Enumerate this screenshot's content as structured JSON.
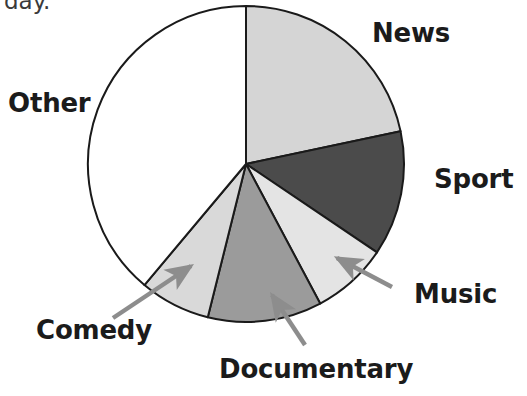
{
  "chart_data": {
    "type": "pie",
    "title": "",
    "subtitle": "",
    "xlabel": "",
    "ylabel": "",
    "legend_position": "callout-labels",
    "grid": false,
    "center": {
      "x": 246,
      "y": 164
    },
    "radius": 158,
    "start_angle_deg": 0,
    "direction": "clockwise",
    "categories": [
      "News",
      "Sport",
      "Music",
      "Documentary",
      "Comedy",
      "Other"
    ],
    "values": [
      78,
      46,
      28,
      42,
      26,
      140
    ],
    "unit": "degrees",
    "percentages": [
      21.7,
      12.8,
      7.8,
      11.7,
      7.2,
      38.9
    ],
    "slices": [
      {
        "label": "News",
        "start_deg": 0,
        "end_deg": 78,
        "sweep_deg": 78,
        "percent": 21.7,
        "color": "#d5d5d5",
        "label_mode": "direct",
        "label_x": 372,
        "label_y": 20
      },
      {
        "label": "Sport",
        "start_deg": 78,
        "end_deg": 124,
        "sweep_deg": 46,
        "percent": 12.8,
        "color": "#4b4b4b",
        "label_mode": "direct",
        "label_x": 434,
        "label_y": 166
      },
      {
        "label": "Music",
        "start_deg": 124,
        "end_deg": 152,
        "sweep_deg": 28,
        "percent": 7.8,
        "color": "#e4e4e4",
        "label_mode": "arrow",
        "label_x": 414,
        "label_y": 281
      },
      {
        "label": "Documentary",
        "start_deg": 152,
        "end_deg": 194,
        "sweep_deg": 42,
        "percent": 11.7,
        "color": "#9b9b9b",
        "label_mode": "arrow",
        "label_x": 219,
        "label_y": 356
      },
      {
        "label": "Comedy",
        "start_deg": 194,
        "end_deg": 220,
        "sweep_deg": 26,
        "percent": 7.2,
        "color": "#d9d9d9",
        "label_mode": "arrow",
        "label_x": 36,
        "label_y": 317
      },
      {
        "label": "Other",
        "start_deg": 220,
        "end_deg": 360,
        "sweep_deg": 140,
        "percent": 38.9,
        "color": "#ffffff",
        "label_mode": "direct",
        "label_x": 8,
        "label_y": 90
      }
    ],
    "callouts": [
      {
        "target": "Music",
        "from_x": 392,
        "from_y": 287,
        "to_x": 337,
        "to_y": 258
      },
      {
        "target": "Documentary",
        "from_x": 305,
        "from_y": 345,
        "to_x": 272,
        "to_y": 295
      },
      {
        "target": "Comedy",
        "from_x": 113,
        "from_y": 318,
        "to_x": 191,
        "to_y": 266
      }
    ],
    "stroke_color": "#1a1a1a",
    "arrow_color": "#8d8d8d",
    "background": "#ffffff"
  },
  "labels": {
    "news": "News",
    "sport": "Sport",
    "music": "Music",
    "documentary": "Documentary",
    "comedy": "Comedy",
    "other": "Other"
  },
  "cut_text": {
    "top_left": "day."
  }
}
